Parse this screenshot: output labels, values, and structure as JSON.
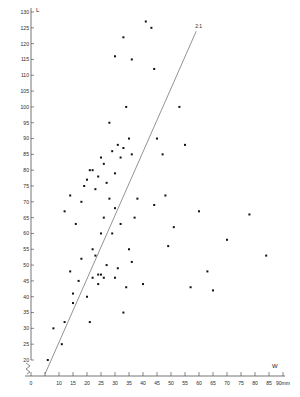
{
  "figure": {
    "title": "",
    "background": "#ffffff"
  },
  "axes": {
    "y_axis_title": "L",
    "x_axis_title": "W",
    "x_unit_label": "90mm",
    "reference_line_label": "2:1"
  },
  "chart_data": {
    "type": "scatter",
    "title": "",
    "xlabel": "W",
    "ylabel": "L",
    "x_unit": "mm",
    "xlim": [
      0,
      90
    ],
    "ylim": [
      0,
      130
    ],
    "y_axis_break": true,
    "y_break_range": [
      0,
      20
    ],
    "grid": false,
    "legend": null,
    "xticks": [
      0,
      5,
      10,
      15,
      20,
      25,
      30,
      35,
      40,
      45,
      50,
      55,
      60,
      65,
      70,
      75,
      80,
      85,
      90
    ],
    "xtick_labels": [
      "0",
      "",
      "10",
      "15",
      "20",
      "25",
      "30",
      "35",
      "40",
      "45",
      "50",
      "55",
      "60",
      "65",
      "70",
      "75",
      "80",
      "85",
      "90mm"
    ],
    "yticks": [
      20,
      25,
      30,
      35,
      40,
      45,
      50,
      55,
      60,
      65,
      70,
      75,
      80,
      85,
      90,
      95,
      100,
      105,
      110,
      115,
      120,
      125,
      130
    ],
    "ytick_labels": [
      "20",
      "25",
      "30",
      "35",
      "40",
      "45",
      "50",
      "55",
      "60",
      "65",
      "70",
      "75",
      "80",
      "85",
      "90",
      "95",
      "100",
      "105",
      "110",
      "115",
      "120",
      "125",
      "130"
    ],
    "reference_line": {
      "label": "2:1",
      "slope": 2.1,
      "intercept": 0,
      "x_start": 5,
      "x_end": 59
    },
    "points": [
      {
        "x": 6,
        "y": 20
      },
      {
        "x": 8,
        "y": 30
      },
      {
        "x": 11,
        "y": 25
      },
      {
        "x": 12,
        "y": 32
      },
      {
        "x": 15,
        "y": 38
      },
      {
        "x": 15,
        "y": 41
      },
      {
        "x": 14,
        "y": 48
      },
      {
        "x": 17,
        "y": 45
      },
      {
        "x": 16,
        "y": 63
      },
      {
        "x": 18,
        "y": 52
      },
      {
        "x": 20,
        "y": 40
      },
      {
        "x": 21,
        "y": 32
      },
      {
        "x": 22,
        "y": 46
      },
      {
        "x": 22,
        "y": 55
      },
      {
        "x": 23,
        "y": 53
      },
      {
        "x": 24,
        "y": 47
      },
      {
        "x": 25,
        "y": 47
      },
      {
        "x": 25,
        "y": 60
      },
      {
        "x": 26,
        "y": 46
      },
      {
        "x": 26,
        "y": 65
      },
      {
        "x": 27,
        "y": 50
      },
      {
        "x": 28,
        "y": 71
      },
      {
        "x": 29,
        "y": 60
      },
      {
        "x": 30,
        "y": 46
      },
      {
        "x": 30,
        "y": 68
      },
      {
        "x": 31,
        "y": 49
      },
      {
        "x": 32,
        "y": 63
      },
      {
        "x": 33,
        "y": 35
      },
      {
        "x": 34,
        "y": 43
      },
      {
        "x": 35,
        "y": 55
      },
      {
        "x": 36,
        "y": 51
      },
      {
        "x": 37,
        "y": 65
      },
      {
        "x": 38,
        "y": 71
      },
      {
        "x": 40,
        "y": 44
      },
      {
        "x": 14,
        "y": 72
      },
      {
        "x": 18,
        "y": 70
      },
      {
        "x": 19,
        "y": 75
      },
      {
        "x": 20,
        "y": 77
      },
      {
        "x": 21,
        "y": 80
      },
      {
        "x": 22,
        "y": 80
      },
      {
        "x": 23,
        "y": 74
      },
      {
        "x": 24,
        "y": 78
      },
      {
        "x": 25,
        "y": 84
      },
      {
        "x": 26,
        "y": 82
      },
      {
        "x": 27,
        "y": 76
      },
      {
        "x": 28,
        "y": 95
      },
      {
        "x": 29,
        "y": 86
      },
      {
        "x": 30,
        "y": 79
      },
      {
        "x": 31,
        "y": 88
      },
      {
        "x": 32,
        "y": 84
      },
      {
        "x": 33,
        "y": 87
      },
      {
        "x": 34,
        "y": 100
      },
      {
        "x": 35,
        "y": 90
      },
      {
        "x": 36,
        "y": 85
      },
      {
        "x": 30,
        "y": 116
      },
      {
        "x": 33,
        "y": 122
      },
      {
        "x": 36,
        "y": 115
      },
      {
        "x": 41,
        "y": 127
      },
      {
        "x": 43,
        "y": 125
      },
      {
        "x": 44,
        "y": 112
      },
      {
        "x": 45,
        "y": 90
      },
      {
        "x": 47,
        "y": 85
      },
      {
        "x": 44,
        "y": 69
      },
      {
        "x": 48,
        "y": 72
      },
      {
        "x": 49,
        "y": 56
      },
      {
        "x": 51,
        "y": 62
      },
      {
        "x": 53,
        "y": 100
      },
      {
        "x": 55,
        "y": 88
      },
      {
        "x": 57,
        "y": 43
      },
      {
        "x": 60,
        "y": 67
      },
      {
        "x": 63,
        "y": 48
      },
      {
        "x": 65,
        "y": 42
      },
      {
        "x": 70,
        "y": 58
      },
      {
        "x": 78,
        "y": 66
      },
      {
        "x": 84,
        "y": 53
      },
      {
        "x": 12,
        "y": 67
      },
      {
        "x": 24,
        "y": 44
      }
    ]
  }
}
